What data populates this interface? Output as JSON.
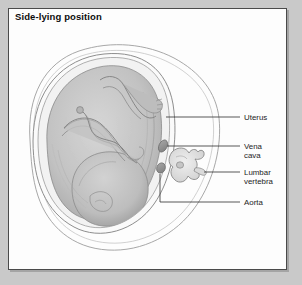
{
  "figure": {
    "title": "Side-lying position",
    "panel_background": "#fdfdfd",
    "outer_background": "#c9c9c9",
    "border_color": "#4a4a4a"
  },
  "labels": [
    {
      "id": "uterus",
      "line1": "Uterus",
      "line2": "",
      "leader_y": 117
    },
    {
      "id": "vena-cava",
      "line1": "Vena",
      "line2": "cava",
      "leader_y": 146
    },
    {
      "id": "lumbar-vertebra",
      "line1": "Lumbar",
      "line2": "vertebra",
      "leader_y": 172
    },
    {
      "id": "aorta",
      "line1": "Aorta",
      "line2": "",
      "leader_y": 202
    }
  ],
  "anatomy": {
    "maternal_outline": "maternal-torso-cross-section",
    "uterus": "uterus-wall",
    "fetus": "fetus-curled-head-down",
    "vena_cava": "vena-cava-vessel",
    "aorta": "aorta-vessel",
    "vertebra": "lumbar-vertebra-body",
    "colors": {
      "outline": "#8e8e8e",
      "uterus_fill": "#f4f4f4",
      "fetus_fill": "#c4c4c4",
      "fetus_shade": "#ababab",
      "vessel_fill": "#9a9a9a",
      "vertebra_fill": "#e2e2e2",
      "leader": "#3a3a3a"
    }
  }
}
